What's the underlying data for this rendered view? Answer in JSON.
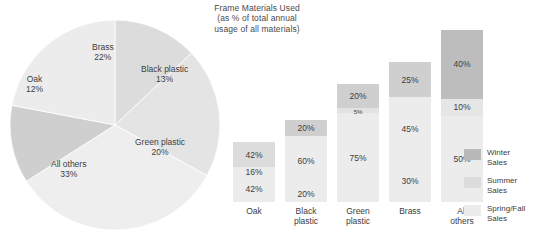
{
  "title_lines": [
    "Frame Materials Used",
    "(as % of total annual",
    "usage of all materials)"
  ],
  "colors": {
    "winter": "#b9b9b9",
    "summer": "#dcdcdc",
    "springfall": "#ececec",
    "pie_brass": "#ececec",
    "pie_black_plastic": "#dcdcdc",
    "pie_green_plastic": "#e4e4e4",
    "pie_all_others": "#eeeeee",
    "pie_oak": "#cfcfcf",
    "text": "#3d3d3d"
  },
  "legend": {
    "items": [
      {
        "label_line1": "Winter",
        "label_line2": "Sales",
        "swatch": "#b9b9b9"
      },
      {
        "label_line1": "Summer",
        "label_line2": "Sales",
        "swatch": "#dcdcdc"
      },
      {
        "label_line1": "Spring/Fall",
        "label_line2": "Sales",
        "swatch": "#ececec"
      }
    ]
  },
  "chart_data": [
    {
      "type": "pie",
      "title": "Frame Materials Used (as % of total annual usage of all materials)",
      "unit": "percent",
      "categories": [
        "Black plastic",
        "Green plastic",
        "All others",
        "Oak",
        "Brass"
      ],
      "values": [
        13,
        20,
        33,
        12,
        22
      ],
      "labels": [
        {
          "name": "Black plastic",
          "value": 13,
          "value_text": "13%"
        },
        {
          "name": "Green plastic",
          "value": 20,
          "value_text": "20%"
        },
        {
          "name": "All others",
          "value": 33,
          "value_text": "33%"
        },
        {
          "name": "Oak",
          "value": 12,
          "value_text": "12%"
        },
        {
          "name": "Brass",
          "value": 22,
          "value_text": "22%"
        }
      ],
      "legend": "none",
      "grid": false
    },
    {
      "type": "bar",
      "subtype": "stacked",
      "title": "",
      "xlabel": "",
      "ylabel": "",
      "unit": "percent",
      "categories": [
        "Oak",
        "Black plastic",
        "Green plastic",
        "Brass",
        "All others"
      ],
      "category_lines": [
        [
          "Oak",
          ""
        ],
        [
          "Black",
          "plastic"
        ],
        [
          "Green",
          "plastic"
        ],
        [
          "Brass",
          ""
        ],
        [
          "All",
          "others"
        ]
      ],
      "series": [
        {
          "name": "Winter Sales",
          "values": [
            42,
            20,
            20,
            25,
            40
          ]
        },
        {
          "name": "Summer Sales",
          "values": [
            16,
            60,
            5,
            45,
            10
          ]
        },
        {
          "name": "Spring/Fall Sales",
          "values": [
            42,
            20,
            75,
            30,
            50
          ]
        }
      ],
      "bar_totals_relative": [
        60,
        82,
        118,
        140,
        172
      ],
      "legend": "right",
      "grid": false,
      "ylim": [
        0,
        100
      ]
    }
  ],
  "bars": [
    {
      "category_l1": "Oak",
      "category_l2": "",
      "left": 5,
      "height": 60,
      "segments": [
        {
          "label": "42%",
          "pct": 42,
          "color": "#dcdcdc",
          "small": false
        },
        {
          "label": "16%",
          "pct": 16,
          "color": "#ececec",
          "small": false
        },
        {
          "label": "42%",
          "pct": 42,
          "color": "#ececec",
          "small": false
        }
      ]
    },
    {
      "category_l1": "Black",
      "category_l2": "plastic",
      "left": 57,
      "height": 82,
      "segments": [
        {
          "label": "20%",
          "pct": 20,
          "color": "#cfcfcf",
          "small": false
        },
        {
          "label": "60%",
          "pct": 60,
          "color": "#ececec",
          "small": false
        },
        {
          "label": "20%",
          "pct": 20,
          "color": "#ececec",
          "small": false
        }
      ]
    },
    {
      "category_l1": "Green",
      "category_l2": "plastic",
      "left": 109,
      "height": 118,
      "segments": [
        {
          "label": "20%",
          "pct": 20,
          "color": "#cfcfcf",
          "small": false
        },
        {
          "label": "5%",
          "pct": 5,
          "color": "#e2e2e2",
          "small": true
        },
        {
          "label": "75%",
          "pct": 75,
          "color": "#ececec",
          "small": false
        }
      ]
    },
    {
      "category_l1": "Brass",
      "category_l2": "",
      "left": 161,
      "height": 140,
      "segments": [
        {
          "label": "25%",
          "pct": 25,
          "color": "#cfcfcf",
          "small": false
        },
        {
          "label": "45%",
          "pct": 45,
          "color": "#ececec",
          "small": false
        },
        {
          "label": "30%",
          "pct": 30,
          "color": "#ececec",
          "small": false
        }
      ]
    },
    {
      "category_l1": "All",
      "category_l2": "others",
      "left": 213,
      "height": 172,
      "segments": [
        {
          "label": "40%",
          "pct": 40,
          "color": "#bdbdbd",
          "small": false
        },
        {
          "label": "10%",
          "pct": 10,
          "color": "#e6e6e6",
          "small": false
        },
        {
          "label": "50%",
          "pct": 50,
          "color": "#ececec",
          "small": false
        }
      ]
    }
  ],
  "pie": {
    "cx": 107,
    "cy": 108,
    "r": 105,
    "slices": [
      {
        "name": "Black plastic",
        "pct": 13,
        "color": "#dcdcdc",
        "start": 0
      },
      {
        "name": "Green plastic",
        "pct": 20,
        "color": "#e4e4e4",
        "start": 13
      },
      {
        "name": "All others",
        "pct": 33,
        "color": "#eeeeee",
        "start": 33
      },
      {
        "name": "Oak",
        "pct": 12,
        "color": "#cfcfcf",
        "start": 66
      },
      {
        "name": "Brass",
        "pct": 22,
        "color": "#ececec",
        "start": 78
      }
    ],
    "labels": [
      {
        "name": "Brass",
        "l1": "Brass",
        "l2": "22%",
        "x": 84,
        "y": 25
      },
      {
        "name": "Black plastic",
        "l1": "Black plastic",
        "l2": "13%",
        "x": 133,
        "y": 47
      },
      {
        "name": "Green plastic",
        "l1": "Green plastic",
        "l2": "20%",
        "x": 127,
        "y": 120
      },
      {
        "name": "All others",
        "l1": "All others",
        "l2": "33%",
        "x": 43,
        "y": 142
      },
      {
        "name": "Oak",
        "l1": "Oak",
        "l2": "12%",
        "x": 18,
        "y": 57
      }
    ]
  }
}
